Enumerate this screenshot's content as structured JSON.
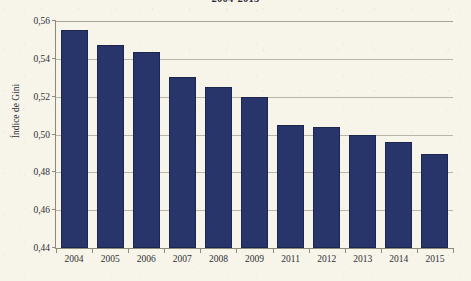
{
  "chart_data": {
    "type": "bar",
    "title": "2004-2015",
    "xlabel": "",
    "ylabel": "Índice de Gini",
    "ylim": [
      0.44,
      0.56
    ],
    "ytick_step": 0.02,
    "ytick_labels": [
      "0,56",
      "0,54",
      "0,52",
      "0,50",
      "0,48",
      "0,46",
      "0,44"
    ],
    "ytick_values": [
      0.56,
      0.54,
      0.52,
      0.5,
      0.48,
      0.46,
      0.44
    ],
    "grid": true,
    "legend": "none",
    "categories": [
      "2004",
      "2005",
      "2006",
      "2007",
      "2008",
      "2009",
      "2011",
      "2012",
      "2013",
      "2014",
      "2015"
    ],
    "values": [
      0.555,
      0.5475,
      0.5435,
      0.5305,
      0.525,
      0.52,
      0.505,
      0.504,
      0.5,
      0.496,
      0.4895
    ],
    "value_labels": [
      "0,555",
      "0,548",
      "0,544",
      "0,531",
      "0,525",
      "0,520",
      "0,505",
      "0,504",
      "0,500",
      "0,496",
      "0,490"
    ],
    "bar_color": "#27356B",
    "background_color": "#F7F5E9",
    "grid_color": "#B9B5A4",
    "axis_color": "#8D8A7C",
    "text_color": "#2F2F36"
  }
}
